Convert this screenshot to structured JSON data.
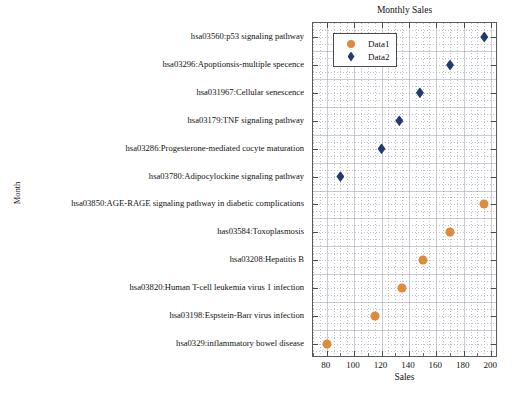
{
  "chart_data": {
    "type": "scatter",
    "title": "Monthly Sales",
    "xlabel": "Sales",
    "ylabel": "Month",
    "xlim": [
      70,
      205
    ],
    "ylim_categories": 12,
    "grid": true,
    "legend_position": "top-left-inside",
    "xticks": [
      80,
      100,
      120,
      140,
      160,
      180,
      200
    ],
    "categories": [
      "hsa03560:p53 signaling pathway",
      "hsa03296:Apoptionsis-multiple specence",
      "hsa031967:Cellular senescence",
      "hsa03179:TNF signaling pathway",
      "hsa03286:Progesterone-mediated cocyte maturation",
      "hsa03780:Adipocylockine signaling pathway",
      "hsa03850:AGE-RAGE signaling pathway in diabetic complications",
      "has03584:Toxoplasmosis",
      "hsa03208:Hepatitis B",
      "hsa03820:Human T-cell leukemia virus 1 infection",
      "hsa03198:Espstein-Barr virus infection",
      "hsa0329:inflammatory bowel disease"
    ],
    "series": [
      {
        "name": "Data1",
        "marker": "circle",
        "color": "#e08a3c",
        "points": [
          {
            "category": "hsa03850:AGE-RAGE signaling pathway in diabetic complications",
            "x": 195
          },
          {
            "category": "has03584:Toxoplasmosis",
            "x": 170
          },
          {
            "category": "hsa03208:Hepatitis B",
            "x": 150
          },
          {
            "category": "hsa03820:Human T-cell leukemia virus 1 infection",
            "x": 135
          },
          {
            "category": "hsa03198:Espstein-Barr virus infection",
            "x": 115
          },
          {
            "category": "hsa0329:inflammatory bowel disease",
            "x": 80
          }
        ]
      },
      {
        "name": "Data2",
        "marker": "diamond",
        "color": "#1f3b73",
        "points": [
          {
            "category": "hsa03560:p53 signaling pathway",
            "x": 195
          },
          {
            "category": "hsa03296:Apoptionsis-multiple specence",
            "x": 170
          },
          {
            "category": "hsa031967:Cellular senescence",
            "x": 148
          },
          {
            "category": "hsa03179:TNF signaling pathway",
            "x": 133
          },
          {
            "category": "hsa03286:Progesterone-mediated cocyte maturation",
            "x": 120
          },
          {
            "category": "hsa03780:Adipocylockine signaling pathway",
            "x": 90
          }
        ]
      }
    ]
  },
  "legend": {
    "entries": [
      {
        "label": "Data1",
        "marker": "circle"
      },
      {
        "label": "Data2",
        "marker": "diamond"
      }
    ]
  }
}
